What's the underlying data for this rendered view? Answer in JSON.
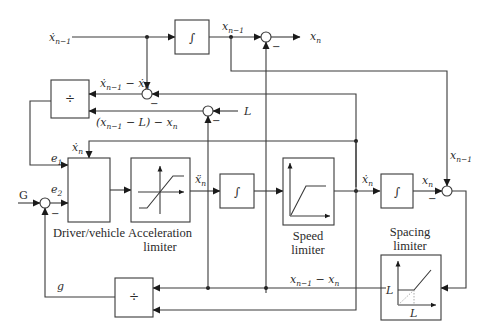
{
  "diagram": {
    "blocks": [
      {
        "id": "integrator-top",
        "symbol": "∫"
      },
      {
        "id": "divide-top",
        "symbol": "÷"
      },
      {
        "id": "driver-vehicle",
        "caption": "Driver/vehicle"
      },
      {
        "id": "acceleration-limiter",
        "caption_line1": "Acceleration",
        "caption_line2": "limiter"
      },
      {
        "id": "integrator-mid",
        "symbol": "∫"
      },
      {
        "id": "speed-limiter",
        "caption_line1": "Speed",
        "caption_line2": "limiter"
      },
      {
        "id": "integrator-right",
        "symbol": "∫"
      },
      {
        "id": "spacing-limiter",
        "caption_line1": "Spacing",
        "caption_line2": "limiter",
        "axis_label_y": "L",
        "axis_label_x": "L"
      },
      {
        "id": "divide-bottom",
        "symbol": "÷"
      }
    ],
    "signals": {
      "xdot_prev": {
        "base": "ẋ",
        "sub": "n−1"
      },
      "x_prev_top": {
        "base": "x",
        "sub": "n−1"
      },
      "x_n_out": {
        "base": "x",
        "sub": "n"
      },
      "rel_speed": {
        "text_a": "ẋ",
        "sub_a": "n−1",
        "op": " − ",
        "text_b": "ẋ",
        "sub_b": "n"
      },
      "L_input": "L",
      "gap_minus_L": {
        "open": "(x",
        "sub_a": "n−1",
        "mid": " − L) − x",
        "sub_b": "n"
      },
      "xdot_n_feedback": {
        "base": "ẋ",
        "sub": "n"
      },
      "e1": {
        "base": "e",
        "sub": "1"
      },
      "e2": {
        "base": "e",
        "sub": "2"
      },
      "G": "G",
      "xddot_n": {
        "base": "ẍ",
        "sub": "n"
      },
      "xdot_n_right": {
        "base": "ẋ",
        "sub": "n"
      },
      "x_n_right": {
        "base": "x",
        "sub": "n"
      },
      "x_prev_right": {
        "base": "x",
        "sub": "n−1"
      },
      "gap": {
        "base_a": "x",
        "sub_a": "n−1",
        "op": " − ",
        "base_b": "x",
        "sub_b": "n"
      },
      "g": "g"
    },
    "sign_marks": {
      "minus": "−"
    }
  }
}
